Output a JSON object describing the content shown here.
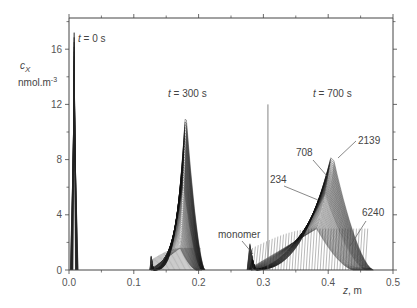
{
  "chart_data": {
    "type": "line",
    "title": "",
    "xlabel": "z, m",
    "ylabel": "c_X",
    "ylabel_units": "nmol.m-3",
    "xlim": [
      0.0,
      0.5
    ],
    "ylim": [
      0,
      18
    ],
    "x_ticks": [
      "0.0",
      "0.1",
      "0.2",
      "0.3",
      "0.4",
      "0.5"
    ],
    "y_ticks": [
      "0",
      "4",
      "8",
      "12",
      "16"
    ],
    "grid": false,
    "annotations": [
      {
        "text": "t = 0 s",
        "x": 0.012,
        "y": 17.0
      },
      {
        "text": "t = 300 s",
        "x": 0.16,
        "y": 13.2
      },
      {
        "text": "t = 700 s",
        "x": 0.345,
        "y": 13.2
      },
      {
        "text": "708",
        "x": 0.325,
        "y": 9.3
      },
      {
        "text": "2139",
        "x": 0.44,
        "y": 10.3
      },
      {
        "text": "234",
        "x": 0.29,
        "y": 6.8
      },
      {
        "text": "6240",
        "x": 0.46,
        "y": 4.8
      },
      {
        "text": "monomer",
        "x": 0.235,
        "y": 2.4
      }
    ],
    "reference_line": {
      "x": 0.307,
      "y_top": 12.0
    },
    "series": [
      {
        "name": "t = 0 s",
        "peak_z": 0.008,
        "peak_c": 17.2,
        "width": 0.002
      },
      {
        "name": "t = 300 s",
        "peak_z": 0.18,
        "peak_c": 11.6,
        "z_start": 0.125,
        "z_end": 0.21,
        "monomer_plateau": 1.6
      },
      {
        "name": "t = 700 s",
        "peak_z": 0.406,
        "peak_c": 8.5,
        "z_start": 0.275,
        "z_end": 0.47,
        "monomer_plateau": 3.0
      }
    ]
  }
}
